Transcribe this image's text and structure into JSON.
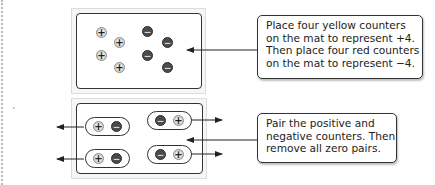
{
  "diagram": {
    "colors": {
      "positive_counter": "#ececec",
      "negative_counter": "#4b4b4b",
      "border": "#333333",
      "mat_background": "#f6f6f6"
    },
    "step1": {
      "mat": {
        "positive_counters": 4,
        "negative_counters": 4,
        "positive_symbol": "+",
        "negative_symbol": "−"
      },
      "callout_lines": [
        "Place four yellow counters",
        "on the mat to represent +4.",
        "Then place four red counters",
        "on the mat to represent −4."
      ]
    },
    "step2": {
      "mat": {
        "zero_pairs": 4,
        "positive_symbol": "+",
        "negative_symbol": "−"
      },
      "callout_lines": [
        "Pair the positive and",
        "negative counters. Then",
        "remove all zero pairs."
      ]
    }
  }
}
